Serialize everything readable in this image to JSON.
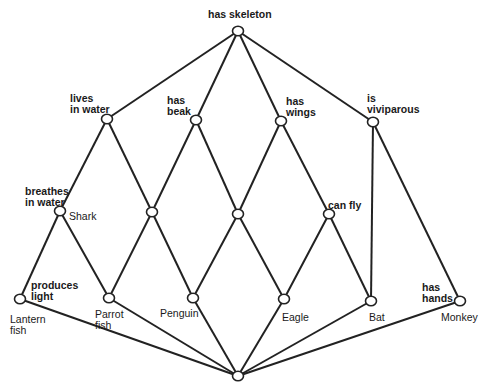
{
  "diagram": {
    "type": "concept lattice",
    "colors": {
      "line": "#222222",
      "node_fill": "#ffffff",
      "text": "#1a1a1a"
    },
    "nodes": [
      {
        "id": "top",
        "x": 238,
        "y": 31,
        "attribute": "has skeleton",
        "object": ""
      },
      {
        "id": "n_water",
        "x": 107,
        "y": 119,
        "attribute": "lives in water",
        "object": ""
      },
      {
        "id": "n_beak",
        "x": 196,
        "y": 120,
        "attribute": "has beak",
        "object": ""
      },
      {
        "id": "n_wings",
        "x": 281,
        "y": 121,
        "attribute": "has wings",
        "object": ""
      },
      {
        "id": "n_vivi",
        "x": 373,
        "y": 122,
        "attribute": "is viviparous",
        "object": ""
      },
      {
        "id": "n_shark",
        "x": 60,
        "y": 211,
        "attribute": "breathes in water",
        "object": "Shark"
      },
      {
        "id": "n_mid1",
        "x": 152,
        "y": 212,
        "attribute": "",
        "object": ""
      },
      {
        "id": "n_mid2",
        "x": 238,
        "y": 214,
        "attribute": "",
        "object": ""
      },
      {
        "id": "n_fly",
        "x": 329,
        "y": 214,
        "attribute": "can fly",
        "object": ""
      },
      {
        "id": "n_lantern",
        "x": 20,
        "y": 299,
        "attribute": "produces light",
        "object": "Lantern fish"
      },
      {
        "id": "n_parrot",
        "x": 109,
        "y": 298,
        "attribute": "",
        "object": "Parrot fish"
      },
      {
        "id": "n_penguin",
        "x": 193,
        "y": 298,
        "attribute": "",
        "object": "Penguin"
      },
      {
        "id": "n_eagle",
        "x": 284,
        "y": 299,
        "attribute": "",
        "object": "Eagle"
      },
      {
        "id": "n_bat",
        "x": 371,
        "y": 301,
        "attribute": "",
        "object": "Bat"
      },
      {
        "id": "n_monkey",
        "x": 460,
        "y": 301,
        "attribute": "has hands",
        "object": "Monkey"
      },
      {
        "id": "bottom",
        "x": 238,
        "y": 376,
        "attribute": "",
        "object": ""
      }
    ],
    "edges": [
      [
        "top",
        "n_water"
      ],
      [
        "top",
        "n_beak"
      ],
      [
        "top",
        "n_wings"
      ],
      [
        "top",
        "n_vivi"
      ],
      [
        "n_water",
        "n_shark"
      ],
      [
        "n_water",
        "n_mid1"
      ],
      [
        "n_beak",
        "n_mid1"
      ],
      [
        "n_beak",
        "n_mid2"
      ],
      [
        "n_wings",
        "n_mid2"
      ],
      [
        "n_wings",
        "n_fly"
      ],
      [
        "n_vivi",
        "n_bat"
      ],
      [
        "n_vivi",
        "n_monkey"
      ],
      [
        "n_shark",
        "n_lantern"
      ],
      [
        "n_shark",
        "n_parrot"
      ],
      [
        "n_mid1",
        "n_parrot"
      ],
      [
        "n_mid1",
        "n_penguin"
      ],
      [
        "n_mid2",
        "n_penguin"
      ],
      [
        "n_mid2",
        "n_eagle"
      ],
      [
        "n_fly",
        "n_eagle"
      ],
      [
        "n_fly",
        "n_bat"
      ],
      [
        "n_lantern",
        "bottom"
      ],
      [
        "n_parrot",
        "bottom"
      ],
      [
        "n_penguin",
        "bottom"
      ],
      [
        "n_eagle",
        "bottom"
      ],
      [
        "n_bat",
        "bottom"
      ],
      [
        "n_monkey",
        "bottom"
      ]
    ]
  },
  "labels": {
    "has_skeleton": "has skeleton",
    "lives_in_water": "lives\nin water",
    "has_beak": "has\nbeak",
    "has_wings": "has\nwings",
    "is_viviparous": "is\nviviparous",
    "breathes_in_water": "breathes\nin water",
    "shark": "Shark",
    "can_fly": "can fly",
    "produces_light": "produces\nlight",
    "lantern_fish": "Lantern\nfish",
    "parrot_fish": "Parrot\nfish",
    "penguin": "Penguin",
    "eagle": "Eagle",
    "bat": "Bat",
    "has_hands": "has\nhands",
    "monkey": "Monkey"
  }
}
